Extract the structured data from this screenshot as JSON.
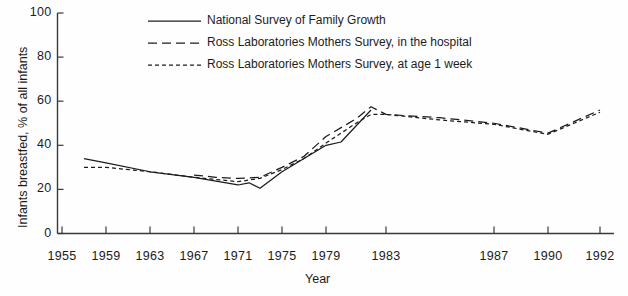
{
  "chart_data": {
    "type": "line",
    "title": "",
    "xlabel": "Year",
    "ylabel": "Infants breastfed, % of all infants",
    "xlim": [
      1955,
      1993
    ],
    "ylim": [
      0,
      100
    ],
    "grid": false,
    "legend_position": "top-center",
    "x_tick_labels": [
      "1955",
      "1959",
      "1963",
      "1967",
      "1971",
      "1975",
      "1979",
      "1983",
      "1987",
      "1990",
      "1992"
    ],
    "x_tick_values": [
      1955,
      1959,
      1963,
      1967,
      1971,
      1975,
      1979,
      1983,
      1987,
      1990,
      1992
    ],
    "y_tick_labels": [
      "0",
      "20",
      "40",
      "60",
      "80",
      "100"
    ],
    "y_tick_values": [
      0,
      20,
      40,
      60,
      80,
      100
    ],
    "series": [
      {
        "name": "National Survey of Family Growth",
        "style": "solid",
        "color": "#1c1c1c",
        "x": [
          1957,
          1959,
          1963,
          1967,
          1971,
          1972,
          1973,
          1975,
          1979,
          1980,
          1982
        ],
        "values": [
          34,
          32,
          28,
          25.5,
          22,
          23,
          20.5,
          28,
          40,
          41.5,
          56
        ]
      },
      {
        "name": "Ross Laboratories Mothers Survey, in the hospital",
        "style": "dashed",
        "color": "#1c1c1c",
        "x": [
          1967,
          1969,
          1971,
          1973,
          1975,
          1977,
          1979,
          1981,
          1982,
          1983,
          1985,
          1987,
          1990,
          1992
        ],
        "values": [
          26.5,
          25.5,
          25,
          25.5,
          30,
          35,
          44,
          52,
          57.5,
          54,
          52.5,
          50,
          45.5,
          56
        ]
      },
      {
        "name": "Ross Laboratories Mothers Survey, at age 1 week",
        "style": "dotted",
        "color": "#1c1c1c",
        "x": [
          1957,
          1959,
          1963,
          1967,
          1971,
          1973,
          1975,
          1977,
          1979,
          1981,
          1982,
          1983,
          1985,
          1987,
          1990,
          1992
        ],
        "values": [
          30,
          30,
          28,
          25.5,
          23.5,
          25,
          29,
          34,
          41,
          50,
          54,
          54,
          51.5,
          49.5,
          45,
          55
        ]
      }
    ]
  },
  "legend": {
    "items": [
      {
        "label": "National Survey of Family Growth",
        "style": "solid"
      },
      {
        "label": "Ross Laboratories Mothers Survey, in the hospital",
        "style": "dashed"
      },
      {
        "label": "Ross Laboratories Mothers Survey, at age 1 week",
        "style": "dotted"
      }
    ]
  }
}
